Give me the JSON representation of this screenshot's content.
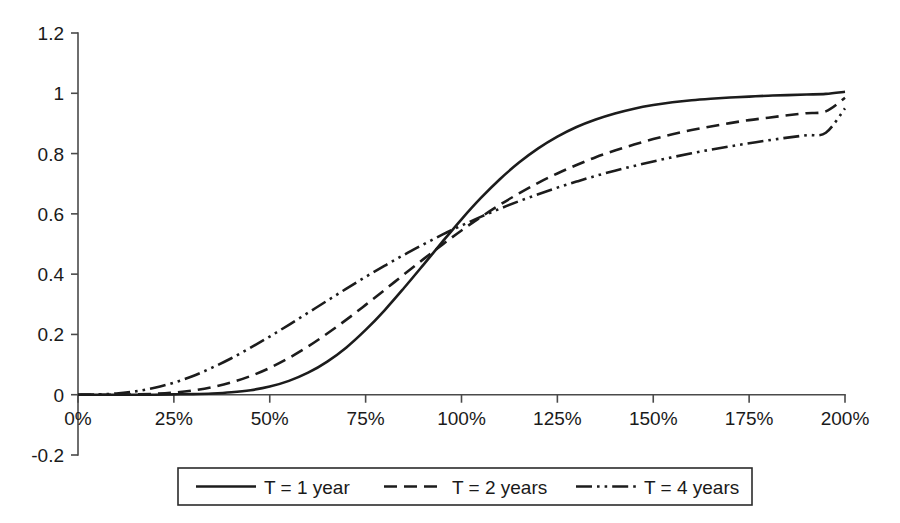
{
  "chart_data": {
    "type": "line",
    "title": "",
    "subtitle": "",
    "xlabel": "",
    "ylabel": "",
    "xlim": [
      0,
      200
    ],
    "ylim": [
      -0.2,
      1.2
    ],
    "grid": false,
    "legend_position": "bottom",
    "x_tick_labels": [
      "0%",
      "25%",
      "50%",
      "75%",
      "100%",
      "125%",
      "150%",
      "175%",
      "200%"
    ],
    "x_tick_values": [
      0,
      25,
      50,
      75,
      100,
      125,
      150,
      175,
      200
    ],
    "y_tick_labels": [
      "1.2",
      "1",
      "0.8",
      "0.6",
      "0.4",
      "0.2",
      "0",
      "-0.2"
    ],
    "y_tick_values": [
      1.2,
      1,
      0.8,
      0.6,
      0.4,
      0.2,
      0,
      -0.2
    ],
    "x": [
      0,
      5,
      10,
      15,
      20,
      25,
      30,
      35,
      40,
      45,
      50,
      55,
      60,
      65,
      70,
      75,
      80,
      85,
      90,
      95,
      100,
      105,
      110,
      115,
      120,
      125,
      130,
      135,
      140,
      145,
      150,
      155,
      160,
      165,
      170,
      175,
      180,
      185,
      190,
      195,
      200
    ],
    "series": [
      {
        "name": "T = 1 year",
        "style": "solid",
        "values": [
          0.0,
          0.0,
          0.0,
          0.0,
          0.0,
          0.001,
          0.002,
          0.004,
          0.008,
          0.015,
          0.027,
          0.046,
          0.073,
          0.11,
          0.157,
          0.215,
          0.281,
          0.354,
          0.43,
          0.507,
          0.582,
          0.652,
          0.715,
          0.77,
          0.817,
          0.856,
          0.888,
          0.913,
          0.933,
          0.949,
          0.961,
          0.97,
          0.977,
          0.982,
          0.986,
          0.989,
          0.992,
          0.994,
          0.996,
          0.998,
          1.005
        ]
      },
      {
        "name": "T = 2 years",
        "style": "dashed",
        "values": [
          0.0,
          0.0,
          0.0,
          0.001,
          0.003,
          0.007,
          0.014,
          0.025,
          0.041,
          0.062,
          0.089,
          0.122,
          0.16,
          0.203,
          0.249,
          0.298,
          0.348,
          0.399,
          0.449,
          0.498,
          0.545,
          0.589,
          0.63,
          0.668,
          0.703,
          0.734,
          0.762,
          0.788,
          0.81,
          0.83,
          0.848,
          0.864,
          0.878,
          0.89,
          0.901,
          0.911,
          0.919,
          0.927,
          0.934,
          0.94,
          0.985
        ]
      },
      {
        "name": "T = 4 years",
        "style": "dashdotdot",
        "values": [
          0.0,
          0.001,
          0.004,
          0.011,
          0.023,
          0.04,
          0.062,
          0.09,
          0.121,
          0.156,
          0.193,
          0.232,
          0.272,
          0.312,
          0.352,
          0.391,
          0.428,
          0.464,
          0.498,
          0.531,
          0.561,
          0.59,
          0.617,
          0.642,
          0.665,
          0.687,
          0.707,
          0.726,
          0.743,
          0.759,
          0.774,
          0.788,
          0.801,
          0.813,
          0.824,
          0.834,
          0.844,
          0.853,
          0.861,
          0.869,
          0.95
        ]
      }
    ],
    "intersection_point": {
      "x": 107,
      "y": 0.66
    }
  },
  "legend": {
    "items": [
      {
        "label": "T = 1 year",
        "style": "solid"
      },
      {
        "label": "T = 2 years",
        "style": "dashed"
      },
      {
        "label": "T = 4 years",
        "style": "dashdotdot"
      }
    ]
  },
  "colors": {
    "line": "#1c1c1c",
    "axis": "#4a4a4a",
    "background": "#ffffff",
    "text": "#1a1a1a"
  }
}
